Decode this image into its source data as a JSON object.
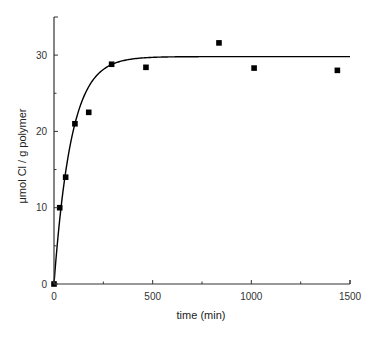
{
  "chart_data": {
    "type": "scatter",
    "title": "",
    "xlabel": "time (min)",
    "ylabel": "μmol Cl / g polymer",
    "xlim": [
      0,
      1500
    ],
    "ylim": [
      0,
      35
    ],
    "x_ticks": [
      0,
      500,
      1000,
      1500
    ],
    "x_minor_ticks": [
      250,
      750,
      1250
    ],
    "y_ticks": [
      0,
      10,
      20,
      30
    ],
    "y_minor_ticks": [
      5,
      15,
      25
    ],
    "grid": false,
    "legend": null,
    "series": [
      {
        "name": "measured",
        "kind": "scatter",
        "marker": "square",
        "color": "#000000",
        "x": [
          0,
          29,
          59,
          106,
          176,
          292,
          466,
          836,
          1014,
          1436
        ],
        "y": [
          0,
          10.0,
          14.0,
          21.0,
          22.5,
          28.8,
          28.4,
          31.6,
          28.3,
          28.0
        ]
      },
      {
        "name": "fit",
        "kind": "line",
        "model": "y = A*(1 - exp(-k*t))",
        "A": 29.8,
        "k": 0.0115,
        "color": "#000000",
        "x_range": [
          0,
          1500
        ]
      }
    ]
  },
  "labels": {
    "xlabel": "time (min)",
    "ylabel": "μmol Cl / g polymer",
    "xtick_0": "0",
    "xtick_500": "500",
    "xtick_1000": "1000",
    "xtick_1500": "1500",
    "ytick_0": "0",
    "ytick_10": "10",
    "ytick_20": "20",
    "ytick_30": "30"
  }
}
